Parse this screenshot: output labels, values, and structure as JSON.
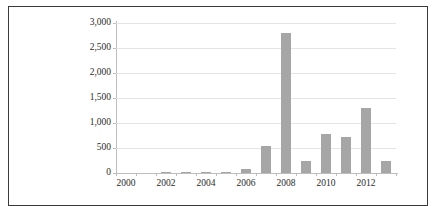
{
  "chart_data": {
    "type": "bar",
    "title": "",
    "subtitle": "",
    "xlabel": "",
    "ylabel": "",
    "categories": [
      "2000",
      "2001",
      "2002",
      "2003",
      "2004",
      "2005",
      "2006",
      "2007",
      "2008",
      "2009",
      "2010",
      "2011",
      "2012",
      "2013"
    ],
    "values": [
      0,
      0,
      2,
      10,
      5,
      15,
      85,
      540,
      2800,
      240,
      790,
      730,
      1310,
      245
    ],
    "series": [
      {
        "name": "",
        "values": [
          0,
          0,
          2,
          10,
          5,
          15,
          85,
          540,
          2800,
          240,
          790,
          730,
          1310,
          245
        ]
      }
    ],
    "ylim": [
      0,
      3000
    ],
    "y_ticks": [
      0,
      500,
      1000,
      1500,
      2000,
      2500,
      3000
    ],
    "y_tick_labels": [
      "0",
      "500",
      "1,000",
      "1,500",
      "2,000",
      "2,500",
      "3,000"
    ],
    "x_tick_labels": [
      "2000",
      "2002",
      "2004",
      "2006",
      "2008",
      "2010",
      "2012"
    ],
    "x_tick_label_years": [
      2000,
      2002,
      2004,
      2006,
      2008,
      2010,
      2012
    ],
    "grid": true,
    "grid_axis": "y",
    "legend": false,
    "legend_position": "none",
    "bar_color": "#a6a6a6",
    "gridline_color": "#e4e4e4",
    "axis_color": "#bdbdbd",
    "text_color": "#2b2b2b",
    "frame_color": "#3a3a3a",
    "background_color": "#ffffff"
  }
}
